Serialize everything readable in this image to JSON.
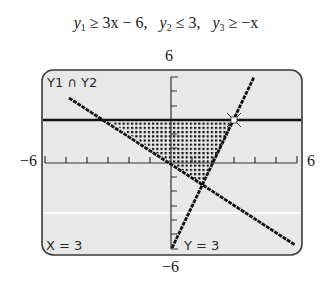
{
  "caption": {
    "ineq1_var": "y",
    "ineq1_sub": "1",
    "ineq1_rest": " ≥ 3x − 6,",
    "ineq2_var": "y",
    "ineq2_sub": "2",
    "ineq2_rest": " ≤ 3,",
    "ineq3_var": "y",
    "ineq3_sub": "3",
    "ineq3_rest": " ≥ −x"
  },
  "axis_labels": {
    "ymax": "6",
    "ymin": "−6",
    "xmin": "−6",
    "xmax": "6"
  },
  "screen": {
    "top_label": "Y1 ∩ Y2",
    "x_readout": "X = 3",
    "y_readout": "Y = 3",
    "background": "#e8e8e8",
    "border": "#3a3a3a",
    "line_color": "#111111"
  },
  "graph": {
    "window": {
      "xmin": -6,
      "xmax": 6,
      "ymin": -6,
      "ymax": 6,
      "xscl": 1,
      "yscl": 1
    },
    "functions": [
      {
        "name": "Y1",
        "expr": "3x - 6",
        "inequality": ">="
      },
      {
        "name": "Y2",
        "expr": "3",
        "inequality": "<="
      },
      {
        "name": "Y3",
        "expr": "-x",
        "inequality": ">="
      }
    ],
    "shaded_region_vertices": [
      [
        -3,
        3
      ],
      [
        3,
        3
      ],
      [
        1.5,
        -1.5
      ]
    ],
    "trace_point": {
      "x": 3,
      "y": 3
    }
  }
}
